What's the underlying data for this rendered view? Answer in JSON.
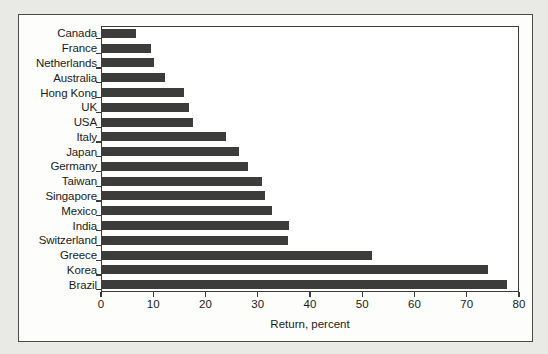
{
  "chart_data": {
    "type": "bar",
    "orientation": "horizontal",
    "title": "",
    "xlabel": "Return, percent",
    "ylabel": "",
    "xlim": [
      0,
      80
    ],
    "ylim": null,
    "grid": false,
    "legend": null,
    "xticks": [
      0,
      10,
      20,
      30,
      40,
      50,
      60,
      70,
      80
    ],
    "xtick_labels": [
      "0",
      "10",
      "20",
      "30",
      "40",
      "50",
      "60",
      "70",
      "80"
    ],
    "categories": [
      "Canada",
      "France",
      "Netherlands",
      "Australia",
      "Hong Kong",
      "UK",
      "USA",
      "Italy",
      "Japan",
      "Germany",
      "Taiwan",
      "Singapore",
      "Mexico",
      "India",
      "Switzerland",
      "Greece",
      "Korea",
      "Brazil"
    ],
    "values": [
      6.7,
      9.5,
      10.2,
      12.3,
      15.8,
      16.8,
      17.6,
      23.9,
      26.4,
      28.1,
      30.9,
      31.3,
      32.7,
      35.9,
      35.7,
      51.8,
      74.0,
      77.7
    ],
    "series": [
      {
        "name": "Return, percent",
        "values": [
          6.7,
          9.5,
          10.2,
          12.3,
          15.8,
          16.8,
          17.6,
          23.9,
          26.4,
          28.1,
          30.9,
          31.3,
          32.7,
          35.9,
          35.7,
          51.8,
          74.0,
          77.7
        ]
      }
    ],
    "colors": {
      "bar": "#3c3c3a",
      "axis": "#3b3b39",
      "text": "#1c1c1c",
      "plot_background": "#ffffff",
      "figure_background": "#fdfdfb",
      "page_background": "#e9e9e6"
    }
  }
}
